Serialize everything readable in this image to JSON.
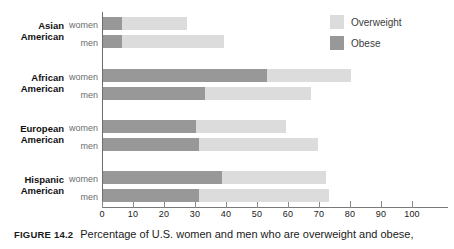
{
  "figure": {
    "number_label": "FIGURE 14.2",
    "caption_text": "Percentage of U.S. women and men who are overweight and obese,"
  },
  "legend": {
    "position": "top-right",
    "items": [
      {
        "label": "Overweight",
        "color": "#dcdcdc",
        "swatch_name": "overweight-swatch"
      },
      {
        "label": "Obese",
        "color": "#989898",
        "swatch_name": "obese-swatch"
      }
    ]
  },
  "axis": {
    "tick_labels": [
      "0",
      "10",
      "20",
      "30",
      "40",
      "50",
      "60",
      "70",
      "80",
      "90",
      "100"
    ],
    "min": 0,
    "max": 110
  },
  "groups": [
    {
      "line1": "Asian",
      "line2": "American",
      "women_label": "women",
      "men_label": "men"
    },
    {
      "line1": "African",
      "line2": "American",
      "women_label": "women",
      "men_label": "men"
    },
    {
      "line1": "European",
      "line2": "American",
      "women_label": "women",
      "men_label": "men"
    },
    {
      "line1": "Hispanic",
      "line2": "American",
      "women_label": "women",
      "men_label": "men"
    }
  ],
  "chart_data": {
    "type": "bar",
    "orientation": "horizontal",
    "stacked": true,
    "title": "Percentage of U.S. women and men who are overweight and obese,",
    "xlabel": "",
    "ylabel": "",
    "xlim": [
      0,
      110
    ],
    "grid": false,
    "legend_position": "top-right",
    "xticks": [
      0,
      10,
      20,
      30,
      40,
      50,
      60,
      70,
      80,
      90,
      100
    ],
    "categories": [
      "Asian American women",
      "Asian American men",
      "African American women",
      "African American men",
      "European American women",
      "European American men",
      "Hispanic American women",
      "Hispanic American men"
    ],
    "series": [
      {
        "name": "Obese",
        "color": "#989898",
        "values": [
          6,
          6,
          53,
          33,
          30,
          31,
          38.5,
          31
        ]
      },
      {
        "name": "Overweight",
        "color": "#dcdcdc",
        "values": [
          21,
          33,
          27,
          34,
          29,
          38.5,
          33.5,
          42
        ]
      }
    ],
    "totals": [
      27,
      39,
      80,
      67,
      59,
      69.5,
      72,
      73
    ]
  },
  "bars": [
    {
      "key": "asian-women",
      "obese": 6,
      "total": 27,
      "top": 17
    },
    {
      "key": "asian-men",
      "obese": 6,
      "total": 39,
      "top": 35
    },
    {
      "key": "african-women",
      "obese": 53,
      "total": 80,
      "top": 69
    },
    {
      "key": "african-men",
      "obese": 33,
      "total": 67,
      "top": 87
    },
    {
      "key": "european-women",
      "obese": 30,
      "total": 59,
      "top": 120
    },
    {
      "key": "european-men",
      "obese": 31,
      "total": 69.5,
      "top": 138
    },
    {
      "key": "hispanic-women",
      "obese": 38.5,
      "total": 72,
      "top": 171
    },
    {
      "key": "hispanic-men",
      "obese": 31,
      "total": 73,
      "top": 189
    }
  ]
}
